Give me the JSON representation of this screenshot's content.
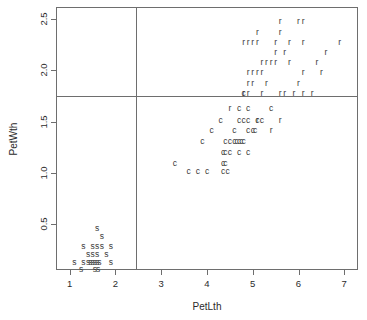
{
  "chart_data": {
    "type": "scatter",
    "title": "",
    "xlabel": "PetLth",
    "ylabel": "PetWth",
    "xlim": [
      0.7,
      7.3
    ],
    "ylim": [
      0.05,
      2.62
    ],
    "xticks": [
      1,
      2,
      3,
      4,
      5,
      6,
      7
    ],
    "xticklabels": [
      "1",
      "2",
      "3",
      "4",
      "5",
      "6",
      "7"
    ],
    "yticks": [
      0.5,
      1.0,
      1.5,
      2.0,
      2.5
    ],
    "yticklabels": [
      "0.5",
      "1.0",
      "1.5",
      "2.0",
      "2.5"
    ],
    "grid": false,
    "legend": "none",
    "marker_style": "text-letter",
    "annotations": {
      "partition_lines": [
        {
          "name": "vertical-split",
          "orientation": "vertical",
          "x": 2.45
        },
        {
          "name": "horizontal-split",
          "orientation": "horizontal",
          "y": 1.75
        }
      ]
    },
    "series": [
      {
        "name": "s",
        "label": "s",
        "color": "#3a3a3a",
        "points": [
          [
            1.6,
            0.46
          ],
          [
            1.7,
            0.38
          ],
          [
            1.3,
            0.28
          ],
          [
            1.5,
            0.28
          ],
          [
            1.6,
            0.28
          ],
          [
            1.7,
            0.28
          ],
          [
            1.9,
            0.28
          ],
          [
            1.4,
            0.21
          ],
          [
            1.5,
            0.21
          ],
          [
            1.6,
            0.21
          ],
          [
            1.8,
            0.21
          ],
          [
            1.1,
            0.13
          ],
          [
            1.3,
            0.13
          ],
          [
            1.4,
            0.13
          ],
          [
            1.45,
            0.13
          ],
          [
            1.5,
            0.13
          ],
          [
            1.55,
            0.13
          ],
          [
            1.6,
            0.13
          ],
          [
            1.65,
            0.13
          ],
          [
            1.9,
            0.13
          ],
          [
            1.25,
            0.06
          ],
          [
            1.55,
            0.06
          ],
          [
            1.62,
            0.06
          ]
        ]
      },
      {
        "name": "c",
        "label": "c",
        "color": "#3a3a3a",
        "points": [
          [
            4.8,
            1.78
          ],
          [
            4.7,
            1.63
          ],
          [
            4.9,
            1.63
          ],
          [
            5.4,
            1.63
          ],
          [
            4.3,
            1.52
          ],
          [
            4.7,
            1.52
          ],
          [
            4.8,
            1.52
          ],
          [
            4.9,
            1.52
          ],
          [
            5.1,
            1.52
          ],
          [
            5.2,
            1.52
          ],
          [
            4.1,
            1.42
          ],
          [
            4.6,
            1.42
          ],
          [
            4.9,
            1.42
          ],
          [
            5.0,
            1.42
          ],
          [
            5.05,
            1.42
          ],
          [
            3.9,
            1.31
          ],
          [
            4.4,
            1.31
          ],
          [
            4.5,
            1.31
          ],
          [
            4.6,
            1.31
          ],
          [
            4.65,
            1.31
          ],
          [
            4.7,
            1.31
          ],
          [
            4.75,
            1.31
          ],
          [
            4.8,
            1.31
          ],
          [
            4.35,
            1.2
          ],
          [
            4.4,
            1.2
          ],
          [
            4.5,
            1.2
          ],
          [
            4.7,
            1.2
          ],
          [
            4.9,
            1.2
          ],
          [
            3.3,
            1.1
          ],
          [
            4.35,
            1.1
          ],
          [
            4.4,
            1.1
          ],
          [
            3.6,
            1.02
          ],
          [
            3.8,
            1.02
          ],
          [
            4.0,
            1.02
          ],
          [
            4.35,
            1.02
          ],
          [
            4.45,
            1.02
          ]
        ]
      },
      {
        "name": "r",
        "label": "r",
        "color": "#3a3a3a",
        "points": [
          [
            5.6,
            2.48
          ],
          [
            6.0,
            2.48
          ],
          [
            6.1,
            2.48
          ],
          [
            5.1,
            2.38
          ],
          [
            5.6,
            2.38
          ],
          [
            4.8,
            2.28
          ],
          [
            4.9,
            2.28
          ],
          [
            5.0,
            2.28
          ],
          [
            5.1,
            2.28
          ],
          [
            5.5,
            2.28
          ],
          [
            5.8,
            2.28
          ],
          [
            6.1,
            2.28
          ],
          [
            6.9,
            2.28
          ],
          [
            5.5,
            2.18
          ],
          [
            5.7,
            2.18
          ],
          [
            6.6,
            2.18
          ],
          [
            5.2,
            2.08
          ],
          [
            5.3,
            2.08
          ],
          [
            5.4,
            2.08
          ],
          [
            5.5,
            2.08
          ],
          [
            5.8,
            2.08
          ],
          [
            6.4,
            2.08
          ],
          [
            4.9,
            1.98
          ],
          [
            5.0,
            1.98
          ],
          [
            5.1,
            1.98
          ],
          [
            5.2,
            1.98
          ],
          [
            6.1,
            1.98
          ],
          [
            6.5,
            1.98
          ],
          [
            4.9,
            1.88
          ],
          [
            5.0,
            1.88
          ],
          [
            5.3,
            1.88
          ],
          [
            6.0,
            1.88
          ],
          [
            4.8,
            1.78
          ],
          [
            4.9,
            1.78
          ],
          [
            5.2,
            1.78
          ],
          [
            5.6,
            1.78
          ],
          [
            5.7,
            1.78
          ],
          [
            5.9,
            1.78
          ],
          [
            6.1,
            1.78
          ],
          [
            6.3,
            1.78
          ],
          [
            4.5,
            1.63
          ],
          [
            5.6,
            1.52
          ],
          [
            5.1,
            1.52
          ],
          [
            5.4,
            1.42
          ]
        ]
      }
    ]
  }
}
